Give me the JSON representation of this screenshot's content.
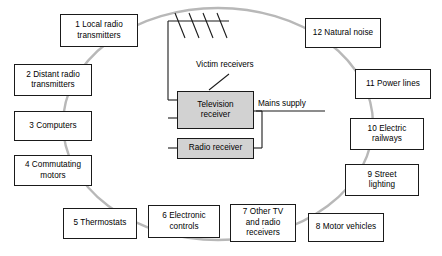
{
  "diagram": {
    "ring_color": "#b8b8b8",
    "box_border_color": "#1a1a1a",
    "victim_fill_color": "#d2d2d2",
    "background_color": "#ffffff",
    "sources": [
      {
        "id": 1,
        "label": "1 Local radio\ntransmitters",
        "x": 60,
        "y": 14,
        "w": 78,
        "h": 33
      },
      {
        "id": 2,
        "label": "2 Distant radio\ntransmitters",
        "x": 14,
        "y": 64,
        "w": 78,
        "h": 32
      },
      {
        "id": 3,
        "label": "3 Computers",
        "x": 14,
        "y": 111,
        "w": 78,
        "h": 30
      },
      {
        "id": 4,
        "label": "4 Commutating\nmotors",
        "x": 14,
        "y": 155,
        "w": 78,
        "h": 31
      },
      {
        "id": 5,
        "label": "5 Thermostats",
        "x": 63,
        "y": 208,
        "w": 74,
        "h": 31
      },
      {
        "id": 6,
        "label": "6 Electronic\ncontrols",
        "x": 148,
        "y": 205,
        "w": 72,
        "h": 33
      },
      {
        "id": 7,
        "label": "7 Other TV\nand radio\nreceivers",
        "x": 230,
        "y": 204,
        "w": 66,
        "h": 38
      },
      {
        "id": 8,
        "label": "8 Motor vehicles",
        "x": 308,
        "y": 213,
        "w": 76,
        "h": 29
      },
      {
        "id": 9,
        "label": "9 Street\nlighting",
        "x": 345,
        "y": 164,
        "w": 74,
        "h": 32
      },
      {
        "id": 10,
        "label": "10 Electric\nrailways",
        "x": 350,
        "y": 118,
        "w": 74,
        "h": 32
      },
      {
        "id": 11,
        "label": "11 Power lines",
        "x": 355,
        "y": 69,
        "w": 76,
        "h": 30
      },
      {
        "id": 12,
        "label": "12 Natural noise",
        "x": 305,
        "y": 18,
        "w": 76,
        "h": 30
      }
    ],
    "victims": [
      {
        "id": "television",
        "label": "Television\nreceiver",
        "x": 177,
        "y": 91,
        "w": 77,
        "h": 38
      },
      {
        "id": "radio",
        "label": "Radio receiver",
        "x": 177,
        "y": 138,
        "w": 77,
        "h": 21
      }
    ],
    "annotations": {
      "victim_receivers": "Victim receivers",
      "mains_supply": "Mains supply"
    },
    "icons": {
      "antenna": "antenna-icon",
      "pointer": "pointer-arrow-icon"
    }
  }
}
